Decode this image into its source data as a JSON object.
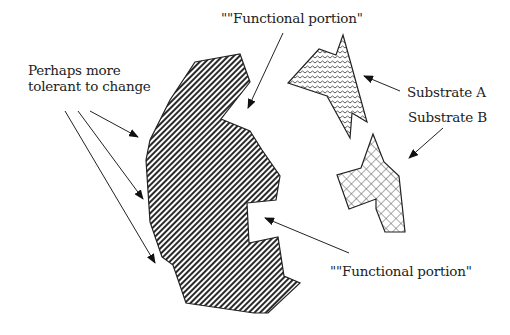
{
  "diagram": {
    "labels": {
      "tolerant_line1": "Perhaps more",
      "tolerant_line2": "tolerant to change",
      "functional_top": "\"\"Functional portion\"",
      "functional_bottom": "\"\"Functional portion\"",
      "substrate_a": "Substrate A",
      "substrate_b": "Substrate B"
    },
    "shapes": [
      {
        "name": "enzyme-body",
        "pattern": "diagonal-hatch"
      },
      {
        "name": "substrate-a",
        "pattern": "wavy"
      },
      {
        "name": "substrate-b",
        "pattern": "crosshatch"
      }
    ],
    "colors": {
      "ink": "#222222",
      "background": "#ffffff"
    }
  }
}
